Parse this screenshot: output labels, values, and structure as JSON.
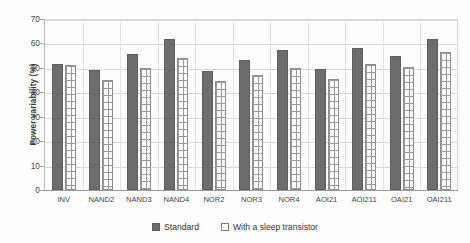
{
  "chart_data": {
    "type": "bar",
    "title": "",
    "xlabel": "",
    "ylabel": "Power variability (%)",
    "ylim": [
      0,
      70
    ],
    "yticks": [
      0,
      10,
      20,
      30,
      40,
      50,
      60,
      70
    ],
    "grid": true,
    "legend_position": "bottom-center",
    "categories": [
      "INV",
      "NAND2",
      "NAND3",
      "NAND4",
      "NOR2",
      "NOR3",
      "NOR4",
      "AOI21",
      "AOI211",
      "OAI21",
      "OAI211"
    ],
    "series": [
      {
        "name": "Standard",
        "color": "#6d6d6d",
        "values": [
          51.5,
          49.0,
          55.7,
          61.8,
          48.8,
          53.3,
          57.3,
          49.7,
          58.2,
          55.0,
          62.0
        ]
      },
      {
        "name": "With a sleep transistor",
        "color": "#fdfdfd",
        "values": [
          51.3,
          45.0,
          49.8,
          54.2,
          44.5,
          47.2,
          50.0,
          45.3,
          51.5,
          50.5,
          56.3
        ]
      }
    ]
  },
  "legend": {
    "items": [
      {
        "label": "Standard",
        "swatch": "filled-gray-square"
      },
      {
        "label": "With a sleep transistor",
        "swatch": "hollow-square"
      }
    ]
  },
  "axis": {
    "y_title": "Power variability (%)"
  }
}
